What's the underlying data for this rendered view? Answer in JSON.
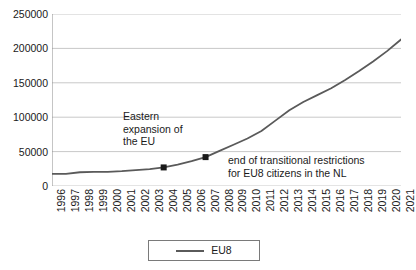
{
  "chart_data": {
    "type": "line",
    "title": "",
    "subtitle": "",
    "xlabel": "",
    "ylabel": "",
    "grid": true,
    "legend_position": "bottom",
    "xlim": [
      1996,
      2021
    ],
    "ylim": [
      0,
      250000
    ],
    "ytick_labels": [
      "250000",
      "200000",
      "150000",
      "100000",
      "50000",
      "0"
    ],
    "ytick_values": [
      250000,
      200000,
      150000,
      100000,
      50000,
      0
    ],
    "categories": [
      "1996",
      "1997",
      "1998",
      "1999",
      "2000",
      "2001",
      "2002",
      "2003",
      "2004",
      "2005",
      "2006",
      "2007",
      "2008",
      "2009",
      "2010",
      "2011",
      "2012",
      "2013",
      "2014",
      "2015",
      "2016",
      "2017",
      "2018",
      "2019",
      "2020",
      "2021"
    ],
    "series": [
      {
        "name": "EU8",
        "color": "#5a5a5a",
        "values": [
          17500,
          17500,
          20000,
          20500,
          20500,
          21500,
          23000,
          24500,
          27000,
          31000,
          36000,
          42000,
          51000,
          60000,
          69000,
          80000,
          95000,
          110000,
          122000,
          132000,
          142000,
          154000,
          167000,
          181000,
          196000,
          213000
        ]
      }
    ],
    "markers": [
      {
        "name": "eastern-expansion-marker",
        "x": "2004",
        "y": 27000,
        "color": "#1a1a1a"
      },
      {
        "name": "transitional-restrictions-marker",
        "x": "2007",
        "y": 42000,
        "color": "#1a1a1a"
      }
    ],
    "annotations": [
      {
        "name": "eastern-expansion",
        "text": "Eastern\nexpansion of\nthe EU"
      },
      {
        "name": "transitional-restrictions",
        "text": "end of transitional restrictions\nfor EU8 citizens in the NL"
      }
    ]
  },
  "legend": {
    "entries": [
      {
        "label": "EU8",
        "color": "#5a5a5a"
      }
    ]
  },
  "colors": {
    "line": "#5a5a5a",
    "marker": "#1a1a1a",
    "grid": "#c8c8c8",
    "axis": "#8c8c8c",
    "text": "#1a1a1a",
    "background": "#ffffff"
  }
}
